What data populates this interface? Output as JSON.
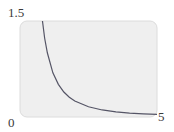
{
  "chart_data": {
    "type": "line",
    "title": "",
    "xlabel": "",
    "ylabel": "",
    "xlim": [
      0,
      5
    ],
    "ylim": [
      0,
      1.5
    ],
    "grid": false,
    "legend": null,
    "tick_labels": {
      "y_top": "1.5",
      "origin": "0",
      "x_right": "5"
    },
    "series": [
      {
        "name": "y = 1/x^2",
        "x": [
          0.82,
          0.9,
          1.0,
          1.2,
          1.4,
          1.6,
          1.8,
          2.0,
          2.5,
          3.0,
          3.5,
          4.0,
          4.5,
          5.0
        ],
        "values": [
          1.5,
          1.23,
          1.0,
          0.69,
          0.51,
          0.39,
          0.31,
          0.25,
          0.16,
          0.11,
          0.08,
          0.06,
          0.05,
          0.04
        ]
      }
    ],
    "colors": {
      "plot_background": "#efefef",
      "plot_border": "#dcdcdc",
      "line": "#555566"
    }
  }
}
